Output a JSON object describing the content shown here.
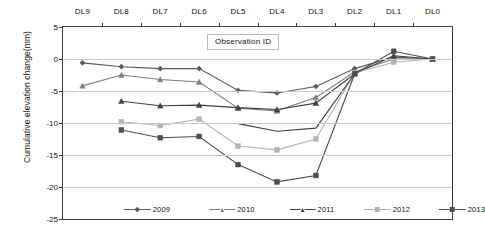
{
  "chart_data": {
    "type": "line",
    "title": "",
    "xlabel": "Observation ID",
    "ylabel": "Cumulative elevation change(mm)",
    "categories": [
      "DL9",
      "DL8",
      "DL7",
      "DL6",
      "DL5",
      "DL4",
      "DL3",
      "DL2",
      "DL1",
      "DL0"
    ],
    "ylim": [
      -25,
      5
    ],
    "yticks": [
      "5",
      "0",
      "-5",
      "-10",
      "-15",
      "-20",
      "-25"
    ],
    "ytick_values": [
      5,
      0,
      -5,
      -10,
      -15,
      -20,
      -25
    ],
    "grid": true,
    "legend_position": "bottom-inside",
    "series": [
      {
        "name": "2009",
        "color": "#595959",
        "marker": "diamond",
        "values": [
          -0.6,
          -1.2,
          -1.5,
          -1.5,
          -4.9,
          -5.3,
          -4.3,
          -1.5,
          0.3,
          0.0
        ]
      },
      {
        "name": "2010",
        "color": "#7f7f7f",
        "marker": "triangle",
        "values": [
          -4.2,
          -2.5,
          -3.2,
          -3.6,
          -7.7,
          -8.1,
          -6.0,
          -2.0,
          0.0,
          0.0
        ]
      },
      {
        "name": "2011",
        "color": "#404040",
        "marker": "triangle",
        "values": [
          null,
          -6.6,
          -7.3,
          -7.2,
          -7.6,
          -7.9,
          -6.9,
          -2.3,
          0.5,
          0.0
        ]
      },
      {
        "name": "2012",
        "color": "#b3b3b3",
        "marker": "square",
        "values": [
          null,
          -9.8,
          -10.4,
          -9.4,
          -13.6,
          -14.2,
          -12.5,
          -2.2,
          -0.5,
          0.0
        ]
      },
      {
        "name": "2013",
        "color": "#4d4d4d",
        "marker": "square",
        "values": [
          null,
          -11.1,
          -12.3,
          -12.1,
          -16.5,
          -19.2,
          -18.2,
          -2.3,
          1.2,
          0.0
        ]
      },
      {
        "name": "2011b",
        "color": "#3f3f3f",
        "marker": "none",
        "hidden": true,
        "values": [
          null,
          null,
          null,
          null,
          -10.1,
          -11.3,
          -10.8,
          -2.3,
          null,
          null
        ]
      }
    ],
    "extra_series_note": "",
    "annotations": []
  },
  "legend": {
    "items": [
      {
        "label": "2009"
      },
      {
        "label": "2010"
      },
      {
        "label": "2011"
      },
      {
        "label": "2012"
      },
      {
        "label": "2013"
      }
    ]
  },
  "axis": {
    "x_title": "Observation ID",
    "y_title": "Cumulative elevation change(mm)"
  }
}
